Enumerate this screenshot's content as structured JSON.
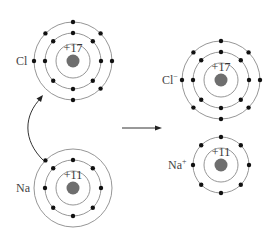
{
  "colors": {
    "background": "#ffffff",
    "shell": "#8a8a8a",
    "electron": "#111111",
    "nucleus": "#6e6e6e",
    "text": "#333333"
  },
  "atoms": [
    {
      "id": "cl-atom",
      "symbol": "Cl",
      "superscript": "",
      "charge_label": "+17",
      "center": [
        73,
        61
      ],
      "shell_radii": [
        17,
        28,
        39
      ],
      "electrons_per_shell": [
        0,
        8,
        7
      ],
      "valence_missing_angle_deg": null
    },
    {
      "id": "na-atom",
      "symbol": "Na",
      "superscript": "",
      "charge_label": "+11",
      "center": [
        73,
        188
      ],
      "shell_radii": [
        17,
        28,
        39
      ],
      "electrons_per_shell": [
        0,
        8,
        1
      ]
    },
    {
      "id": "cl-ion",
      "symbol": "Cl",
      "superscript": "−",
      "charge_label": "+17",
      "center": [
        221,
        80
      ],
      "shell_radii": [
        17,
        28,
        39
      ],
      "electrons_per_shell": [
        0,
        8,
        8
      ]
    },
    {
      "id": "na-ion",
      "symbol": "Na",
      "superscript": "+",
      "charge_label": "+11",
      "center": [
        221,
        165
      ],
      "shell_radii": [
        17,
        28
      ],
      "electrons_per_shell": [
        0,
        8
      ]
    }
  ],
  "labels": {
    "cl_atom": "Cl",
    "na_atom": "Na",
    "cl_ion": "Cl",
    "cl_ion_sup": "−",
    "na_ion": "Na",
    "na_ion_sup": "+",
    "cl_charge": "+17",
    "na_charge": "+11",
    "cl_ion_charge": "+17",
    "na_ion_charge": "+11"
  },
  "arrows": {
    "reaction": {
      "from": [
        122,
        128
      ],
      "to": [
        162,
        128
      ]
    },
    "transfer": {
      "from": "na-valence-electron",
      "to": "cl-atom-outer-shell"
    }
  }
}
